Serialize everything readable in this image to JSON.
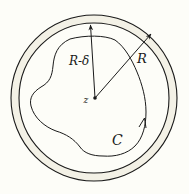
{
  "diagram": {
    "type": "geometric-annulus-contour",
    "labels": {
      "center_point": "z",
      "inner_radius": "R-δ",
      "outer_radius": "R",
      "contour": "C"
    },
    "colors": {
      "background": "#fdfdf8",
      "ring_fill": "#f3f1e6",
      "stroke": "#1a1a1a"
    },
    "geometry": {
      "center": [
        94,
        98
      ],
      "outer_circle_radius": 83,
      "inner_circle_radius": 75,
      "contour_direction": "counterclockwise"
    }
  }
}
